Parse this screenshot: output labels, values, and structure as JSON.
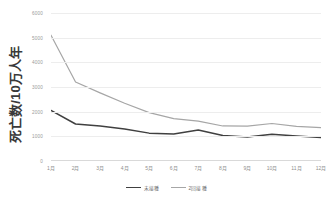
{
  "chart_data": {
    "type": "line",
    "title": "",
    "xlabel": "",
    "ylabel": "死亡数/10万人年",
    "categories": [
      "1月",
      "2月",
      "3月",
      "4月",
      "5月",
      "6月",
      "7月",
      "8月",
      "9月",
      "10月",
      "11月",
      "12月"
    ],
    "ylim": [
      0,
      6000
    ],
    "ytick_values": [
      0,
      1000,
      2000,
      3000,
      4000,
      5000,
      6000
    ],
    "ytick_labels": [
      "0",
      "1000",
      "2000",
      "3000",
      "4000",
      "5000",
      "6000"
    ],
    "grid": true,
    "legend_position": "bottom",
    "series": [
      {
        "name": "未接種",
        "color": "#404040",
        "values": [
          2050,
          1500,
          1420,
          1300,
          1130,
          1090,
          1260,
          1030,
          970,
          1080,
          1010,
          950
        ]
      },
      {
        "name": "2回接種",
        "color": "#a6a6a6",
        "values": [
          5100,
          3200,
          2760,
          2340,
          1960,
          1720,
          1620,
          1420,
          1410,
          1520,
          1400,
          1350
        ]
      }
    ]
  },
  "axis": {
    "y_title": "死亡数/10万人年"
  },
  "colors": {
    "series_1": "#404040",
    "series_2": "#a6a6a6",
    "gridline": "#ededed",
    "tick_text": "#9a9a9a",
    "background": "#ffffff"
  }
}
